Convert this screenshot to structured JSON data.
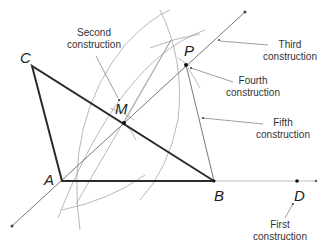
{
  "diagram": {
    "type": "geometric-construction",
    "points": {
      "A": {
        "label": "A",
        "x": 62,
        "y": 181
      },
      "B": {
        "label": "B",
        "x": 214,
        "y": 181
      },
      "C": {
        "label": "C",
        "x": 32,
        "y": 66
      },
      "D": {
        "label": "D",
        "x": 297,
        "y": 181
      },
      "M": {
        "label": "M",
        "x": 124,
        "y": 123
      },
      "P": {
        "label": "P",
        "x": 186,
        "y": 65
      }
    },
    "annotations": {
      "first": {
        "line1": "First",
        "line2": "construction"
      },
      "second": {
        "line1": "Second",
        "line2": "construction"
      },
      "third": {
        "line1": "Third",
        "line2": "construction"
      },
      "fourth": {
        "line1": "Fourth",
        "line2": "construction"
      },
      "fifth": {
        "line1": "Fifth",
        "line2": "construction"
      }
    },
    "colors": {
      "triangle": "#2b2b2b",
      "construction_line": "#555555",
      "arc": "#9a9a9a",
      "text": "#333333"
    }
  }
}
